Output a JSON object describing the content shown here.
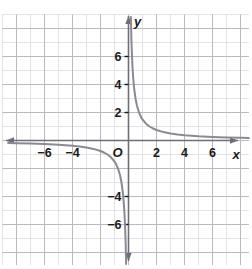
{
  "figure": {
    "kind": "coordinate-plane-graph",
    "background_color": "#ffffff",
    "grid": {
      "minor_color": "#e3e3e6",
      "major_color": "#b9b9bf",
      "minor_step_units": 1,
      "major_step_units": 2,
      "pixels_per_unit": 14,
      "x_range": [
        -9,
        8.6
      ],
      "y_range": [
        -8.9,
        9
      ]
    },
    "axes": {
      "color": "#6e6e78",
      "x_axis_label": "x",
      "y_axis_label": "y",
      "origin_label": "O",
      "arrows": [
        "left",
        "right",
        "up",
        "down"
      ]
    },
    "curve": {
      "color": "#8a8a92",
      "stroke_width": 2.0
    }
  },
  "chart_data": {
    "type": "line",
    "title": "",
    "subtitle": "",
    "xlabel": "x",
    "ylabel": "y",
    "xlim": [
      -9,
      8.6
    ],
    "ylim": [
      -8.9,
      9
    ],
    "grid": true,
    "legend": "none",
    "x_ticks": [
      -6,
      -4,
      2,
      4,
      6
    ],
    "x_tick_labels": [
      "−6",
      "−4",
      "2",
      "4",
      "6"
    ],
    "y_ticks": [
      6,
      4,
      2,
      -4,
      -6
    ],
    "y_tick_labels": [
      "6",
      "4",
      "2",
      "−4",
      "−6"
    ],
    "origin_label": "O",
    "annotations": [],
    "series": [
      {
        "name": "y = 1.5/x (branch x > 0)",
        "equation": "y = 1.5/x",
        "x": [
          0.17,
          0.19,
          0.21,
          0.25,
          0.3,
          0.35,
          0.4,
          0.5,
          0.6,
          0.75,
          0.9,
          1.0,
          1.25,
          1.5,
          1.75,
          2.0,
          2.5,
          3.0,
          3.5,
          4.0,
          5.0,
          6.0,
          7.0,
          8.0,
          8.6
        ],
        "y": [
          8.82,
          7.89,
          7.14,
          6.0,
          5.0,
          4.29,
          3.75,
          3.0,
          2.5,
          2.0,
          1.67,
          1.5,
          1.2,
          1.0,
          0.86,
          0.75,
          0.6,
          0.5,
          0.43,
          0.375,
          0.3,
          0.25,
          0.214,
          0.188,
          0.174
        ]
      },
      {
        "name": "y = 1.5/x (branch x < 0)",
        "equation": "y = 1.5/x",
        "x": [
          -8.6,
          -8.0,
          -7.0,
          -6.0,
          -5.0,
          -4.0,
          -3.5,
          -3.0,
          -2.5,
          -2.0,
          -1.75,
          -1.5,
          -1.25,
          -1.0,
          -0.9,
          -0.75,
          -0.6,
          -0.5,
          -0.4,
          -0.35,
          -0.3,
          -0.25,
          -0.21,
          -0.19,
          -0.17
        ],
        "y": [
          -0.174,
          -0.188,
          -0.214,
          -0.25,
          -0.3,
          -0.375,
          -0.43,
          -0.5,
          -0.6,
          -0.75,
          -0.86,
          -1.0,
          -1.2,
          -1.5,
          -1.67,
          -2.0,
          -2.5,
          -3.0,
          -3.75,
          -4.29,
          -5.0,
          -6.0,
          -7.14,
          -7.89,
          -8.82
        ]
      }
    ]
  }
}
